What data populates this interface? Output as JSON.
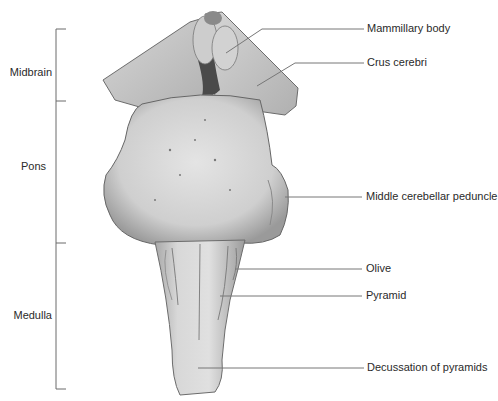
{
  "figure": {
    "regions": [
      {
        "label": "Midbrain"
      },
      {
        "label": "Pons"
      },
      {
        "label": "Medulla"
      }
    ],
    "structures": [
      {
        "label": "Mammillary body"
      },
      {
        "label": "Crus cerebri"
      },
      {
        "label": "Middle cerebellar peduncle"
      },
      {
        "label": "Olive"
      },
      {
        "label": "Pyramid"
      },
      {
        "label": "Decussation of pyramids"
      }
    ],
    "colors": {
      "leader_line": "#777777",
      "bracket": "#6a6a6a",
      "tissue_light": "#d9d9d9",
      "tissue_mid": "#bdbdbd",
      "tissue_dark": "#555555"
    }
  }
}
